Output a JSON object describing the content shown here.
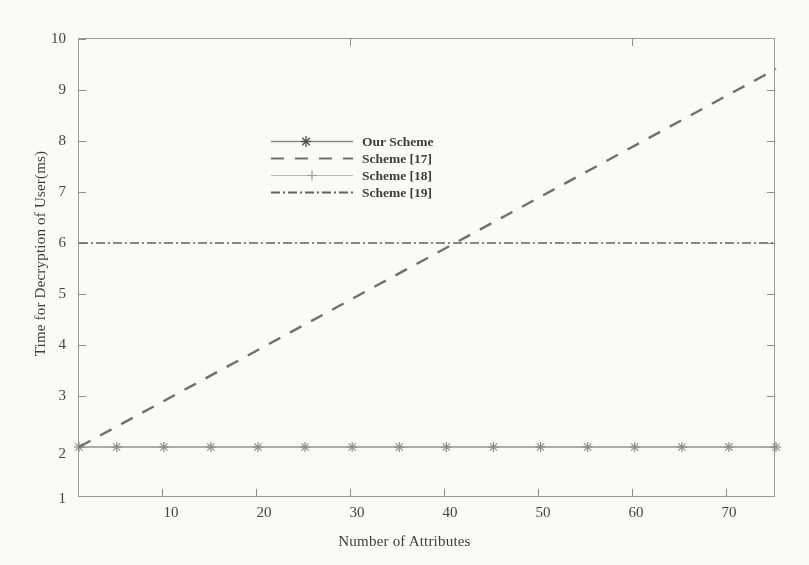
{
  "chart_data": {
    "type": "line",
    "title": "",
    "xlabel": "Number of Attributes",
    "ylabel": "Time for Decryption of User(ms)",
    "xlim": [
      1,
      75
    ],
    "ylim": [
      1,
      10
    ],
    "xticks": [
      10,
      20,
      30,
      40,
      50,
      60,
      70
    ],
    "yticks": [
      1,
      2,
      3,
      4,
      5,
      6,
      7,
      8,
      9,
      10
    ],
    "grid": false,
    "legend_position": "upper-left-inside",
    "series": [
      {
        "name": "Our Scheme",
        "style": "solid",
        "marker": "star",
        "color": "#8a8a8a",
        "x": [
          1,
          5,
          10,
          15,
          20,
          25,
          30,
          35,
          40,
          45,
          50,
          55,
          60,
          65,
          70,
          75
        ],
        "values": [
          2,
          2,
          2,
          2,
          2,
          2,
          2,
          2,
          2,
          2,
          2,
          2,
          2,
          2,
          2,
          2
        ]
      },
      {
        "name": "Scheme [17]",
        "style": "dashed",
        "marker": "none",
        "color": "#6e6e6e",
        "x": [
          1,
          75
        ],
        "values": [
          2,
          9.4
        ]
      },
      {
        "name": "Scheme [18]",
        "style": "solid-light",
        "marker": "plus",
        "color": "#b2b2b2",
        "x": [
          1,
          5,
          10,
          15,
          20,
          25,
          30,
          35,
          40,
          45,
          50,
          55,
          60,
          65,
          70,
          75
        ],
        "values": [
          2,
          2,
          2,
          2,
          2,
          2,
          2,
          2,
          2,
          2,
          2,
          2,
          2,
          2,
          2,
          2
        ]
      },
      {
        "name": "Scheme [19]",
        "style": "dash-dot",
        "marker": "none",
        "color": "#5f5f5f",
        "x": [
          1,
          75
        ],
        "values": [
          6,
          6
        ]
      }
    ],
    "annotations": [
      "Scheme [17] crosses Scheme [19] at approximately 40 attributes (6 ms)."
    ]
  },
  "legend": {
    "items": [
      {
        "label": "Our Scheme"
      },
      {
        "label": "Scheme [17]"
      },
      {
        "label": "Scheme [18]"
      },
      {
        "label": "Scheme [19]"
      }
    ]
  },
  "axes": {
    "x_tick_labels": [
      "10",
      "20",
      "30",
      "40",
      "50",
      "60",
      "70"
    ],
    "y_tick_labels": [
      "1",
      "2",
      "3",
      "4",
      "5",
      "6",
      "7",
      "8",
      "9",
      "10"
    ],
    "x_title": "Number of Attributes",
    "y_title": "Time for Decryption of User(ms)"
  }
}
